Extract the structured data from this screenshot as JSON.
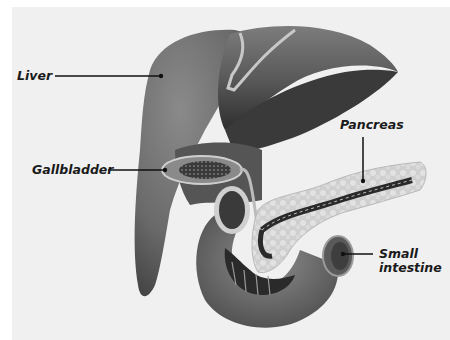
{
  "figure": {
    "type": "anatomical-illustration",
    "style": "grayscale",
    "background": "#f0f0f0"
  },
  "labels": {
    "liver": "Liver",
    "gallbladder": "Gallbladder",
    "pancreas": "Pancreas",
    "small_intestine": "Small intestine"
  },
  "colors": {
    "organ_dark": "#3c3c3c",
    "organ_mid": "#6e6e6e",
    "organ_light": "#9a9a9a",
    "pancreas_tissue": "#d2d2d2",
    "leader_line": "#111111"
  }
}
